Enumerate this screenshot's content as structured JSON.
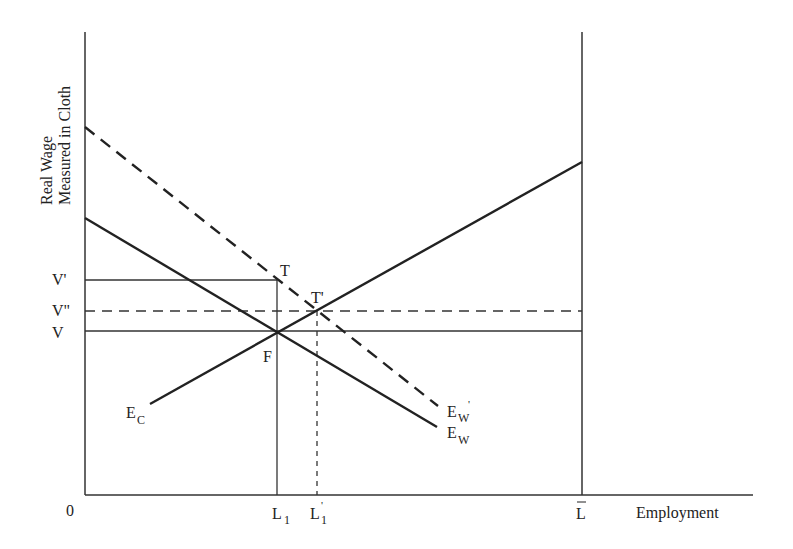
{
  "diagram": {
    "type": "labor-market equilibrium diagram",
    "y_axis_label_line1": "Real Wage",
    "y_axis_label_line2": "Measured in Cloth",
    "x_axis_label": "Employment",
    "origin_label": "0",
    "wage_levels": [
      {
        "id": "V_prime",
        "label": "V'",
        "style": "solid"
      },
      {
        "id": "V_double_prime",
        "label": "V\"",
        "style": "dashed"
      },
      {
        "id": "V",
        "label": "V",
        "style": "solid"
      }
    ],
    "employment_levels": [
      {
        "id": "L1",
        "label": "L",
        "sub": "1",
        "style": "solid"
      },
      {
        "id": "L1_prime",
        "label": "L",
        "sub": "1",
        "sup": "'",
        "style": "dashed"
      },
      {
        "id": "Lbar",
        "label": "L",
        "bar": true,
        "style": "solid"
      }
    ],
    "curves": [
      {
        "id": "E_W",
        "label": "E",
        "sub": "W",
        "style": "solid",
        "slope": "downward"
      },
      {
        "id": "E_W_prime",
        "label": "E",
        "sub": "W",
        "sup": "'",
        "style": "dashed",
        "slope": "downward"
      },
      {
        "id": "E_C",
        "label": "E",
        "sub": "C",
        "style": "solid",
        "slope": "upward"
      }
    ],
    "points": [
      {
        "id": "F",
        "label": "F"
      },
      {
        "id": "T",
        "label": "T"
      },
      {
        "id": "T_prime",
        "label": "T'"
      }
    ]
  }
}
